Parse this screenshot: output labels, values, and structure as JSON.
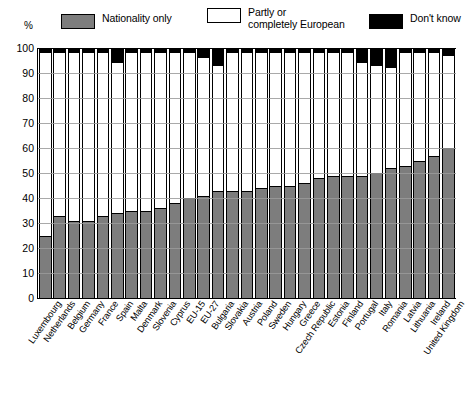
{
  "legend": {
    "items": [
      {
        "key": "nationality-only",
        "label": "Nationality only",
        "color": "#7d7d7d"
      },
      {
        "key": "partly-or-completely-european",
        "label": "Partly or\ncompletely European",
        "color": "#ffffff"
      },
      {
        "key": "dont-know",
        "label": "Don't know",
        "color": "#000000"
      }
    ]
  },
  "axis": {
    "y_unit_label": "%",
    "y_ticks": [
      0,
      10,
      20,
      30,
      40,
      50,
      60,
      70,
      80,
      90,
      100
    ]
  },
  "chart_data": {
    "type": "bar",
    "title": "",
    "xlabel": "",
    "ylabel": "%",
    "ylim": [
      0,
      100
    ],
    "grid": true,
    "stacked": true,
    "legend_position": "top",
    "categories": [
      "Luxembourg",
      "Netherlands",
      "Belgium",
      "Germany",
      "France",
      "Spain",
      "Malta",
      "Denmark",
      "Slovenia",
      "Cyprus",
      "EU-15",
      "EU-27",
      "Bulgaria",
      "Slovakia",
      "Austria",
      "Poland",
      "Sweden",
      "Hungary",
      "Greece",
      "Czech Republic",
      "Estonia",
      "Finland",
      "Portugal",
      "Italy",
      "Romania",
      "Latvia",
      "Lithuania",
      "Ireland",
      "United Kingdom"
    ],
    "series": [
      {
        "name": "Nationality only",
        "color": "#7d7d7d",
        "values": [
          25,
          33,
          31,
          31,
          33,
          34,
          35,
          35,
          36,
          38,
          40,
          41,
          43,
          43,
          43,
          44,
          45,
          45,
          46,
          48,
          49,
          49,
          49,
          50,
          52,
          53,
          55,
          57,
          60
        ]
      },
      {
        "name": "Partly or completely European",
        "color": "#ffffff",
        "values": [
          73,
          65,
          67,
          67,
          65,
          60,
          63,
          63,
          62,
          60,
          58,
          55,
          50,
          55,
          55,
          54,
          53,
          53,
          52,
          50,
          49,
          49,
          45,
          43,
          40,
          45,
          43,
          41,
          37
        ]
      },
      {
        "name": "Don't know",
        "color": "#000000",
        "values": [
          2,
          2,
          2,
          2,
          2,
          6,
          2,
          2,
          2,
          2,
          2,
          4,
          7,
          2,
          2,
          2,
          2,
          2,
          2,
          2,
          2,
          2,
          6,
          7,
          8,
          2,
          2,
          2,
          3
        ]
      }
    ]
  }
}
